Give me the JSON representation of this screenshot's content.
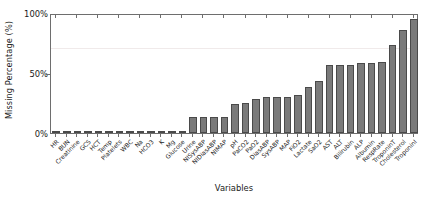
{
  "chart_data": {
    "type": "bar",
    "title": "",
    "xlabel": "Variables",
    "ylabel": "Missing Percentage (%)",
    "ylim": [
      0,
      100
    ],
    "yticks": [
      0,
      50,
      100
    ],
    "ytick_labels": [
      "0%",
      "50%",
      "100%"
    ],
    "grid": false,
    "reference_lines": [
      70
    ],
    "legend": null,
    "bar_color": "#7a7a7a",
    "bar_edge_color": "#4a4a4a",
    "axis_color": "#6e6e6e",
    "categories": [
      "HR",
      "BUN",
      "Creatinine",
      "GCS",
      "HCT",
      "Temp",
      "Platelets",
      "WBC",
      "Na",
      "HCO3",
      "K",
      "Mg",
      "Glucose",
      "Urine",
      "NISysABP",
      "NIDiasABP",
      "NIMAP",
      "pH",
      "PaCO2",
      "PaO2",
      "DiasABP",
      "SysABP",
      "MAP",
      "FiO2",
      "Lactate",
      "SaO2",
      "AST",
      "ALT",
      "Bilirubin",
      "ALP",
      "Albumin",
      "RespRate",
      "TroponinT",
      "Cholesterol",
      "TroponinI"
    ],
    "values": [
      1,
      1,
      1,
      1,
      1,
      1,
      1,
      1,
      1,
      1,
      2,
      2,
      2,
      13,
      13,
      13,
      13,
      24,
      25,
      28,
      30,
      30,
      30,
      32,
      38,
      43,
      57,
      57,
      57,
      58,
      58,
      59,
      73,
      86,
      95
    ]
  }
}
